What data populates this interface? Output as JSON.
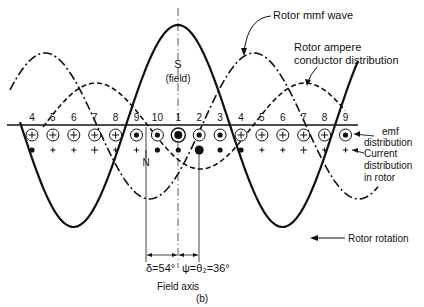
{
  "figure": {
    "caption": "(b)",
    "field_pole_label": "S",
    "field_pole_sublabel": "(field)",
    "north_label": "N",
    "field_axis_label": "Field axis",
    "angle_delta_label": "δ=54°",
    "angle_psi_label": "ψ=θ₂=36°",
    "rotation_label": "Rotor rotation"
  },
  "annotations": {
    "rotor_mmf_wave": "Rotor mmf wave",
    "rotor_ampere_line1": "Rotor ampere",
    "rotor_ampere_line2": "conductor distribution",
    "emf_line1": "emf",
    "emf_line2": "distribution",
    "current_line1": "Current",
    "current_line2": "distribution",
    "current_line3": "in rotor"
  },
  "conductors": {
    "numbers": [
      "4",
      "5",
      "6",
      "7",
      "8",
      "9",
      "10",
      "1",
      "2",
      "3",
      "4",
      "5",
      "6",
      "7",
      "8",
      "9"
    ],
    "emf_symbols": [
      "plus",
      "plus",
      "plus",
      "plus",
      "plus",
      "dot",
      "dot",
      "bigdot",
      "dot",
      "dot",
      "plus",
      "plus",
      "plus",
      "plus",
      "plus",
      "dot"
    ],
    "current_symbols": [
      "dot",
      "plus",
      "plus",
      "plus",
      "plus",
      "plus",
      "dot",
      "dot",
      "bigdot",
      "dot",
      "dot",
      "plus",
      "plus",
      "plus",
      "plus",
      "plus"
    ]
  },
  "waves": {
    "field_flux": {
      "style": "solid",
      "peak_deg": 0,
      "description": "Field flux density wave centered on field axis"
    },
    "rotor_mmf": {
      "style": "dash-dot",
      "peak_deg": -90
    },
    "rotor_ampere_conductor": {
      "style": "dashed",
      "peak_deg": -54
    }
  }
}
